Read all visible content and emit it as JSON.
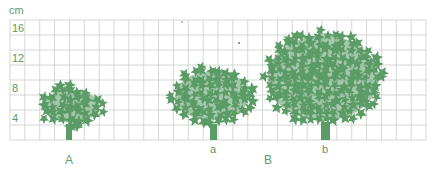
{
  "figure": {
    "unit_label": "cm",
    "y_axis": {
      "min": 0,
      "max": 16,
      "cell_size_cm": 2,
      "ticks": [
        "16",
        "12",
        "8",
        "4"
      ],
      "tick_values": [
        16,
        12,
        8,
        4
      ]
    },
    "grid": {
      "columns": 28,
      "rows": 8
    },
    "colors": {
      "tree": "#5b9b66",
      "grid_line": "#c9cec9",
      "label": "#5b9b66"
    },
    "trees": [
      {
        "id": "A",
        "label": "a_tree_A",
        "canopy_height_cm": 8,
        "canopy_width_cells": 4.6,
        "shape": "small-round",
        "label_text": ""
      },
      {
        "id": "a",
        "label_text": "a",
        "canopy_height_cm": 10,
        "canopy_width_cells": 5.6,
        "shape": "medium-round"
      },
      {
        "id": "b",
        "label_text": "b",
        "canopy_height_cm": 15,
        "canopy_width_cells": 8.2,
        "shape": "large-round"
      }
    ],
    "group_labels": [
      {
        "id": "group-A",
        "text": "A"
      },
      {
        "id": "group-B",
        "text": "B"
      }
    ]
  }
}
